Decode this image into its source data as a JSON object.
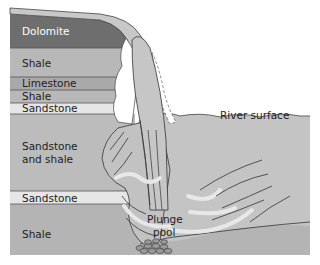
{
  "diagram": {
    "title": "",
    "layers": [
      {
        "name": "Dolomite",
        "color": "#6e6e6e",
        "top": 14,
        "bottom": 48
      },
      {
        "name": "Shale",
        "color": "#b8b8b8",
        "top": 48,
        "bottom": 77
      },
      {
        "name": "Limestone",
        "color": "#a9a9a9",
        "top": 77,
        "bottom": 90
      },
      {
        "name": "Shale",
        "color": "#b8b8b8",
        "top": 90,
        "bottom": 103
      },
      {
        "name": "Sandstone",
        "color": "#e6e6e6",
        "top": 103,
        "bottom": 114
      },
      {
        "name": "Sandstone\nand shale",
        "color": "#bcbcbc",
        "top": 114,
        "bottom": 191
      },
      {
        "name": "Sandstone",
        "color": "#e6e6e6",
        "top": 191,
        "bottom": 204
      },
      {
        "name": "Shale",
        "color": "#b4b4b4",
        "top": 204,
        "bottom": 255
      }
    ],
    "labels": {
      "dolomite": "Dolomite",
      "shale_1": "Shale",
      "limestone": "Limestone",
      "shale_2": "Shale",
      "sandstone_1": "Sandstone",
      "sandstone_and_shale_line1": "Sandstone",
      "sandstone_and_shale_line2": "and shale",
      "sandstone_2": "Sandstone",
      "shale_3": "Shale",
      "river_surface": "River surface",
      "plunge_pool_line1": "Plunge",
      "plunge_pool_line2": "pool"
    },
    "colors": {
      "water": "#c4c4c4",
      "water_light": "#d8d8d8",
      "foam": "#ffffff",
      "outline": "#333333",
      "text_dark": "#222222",
      "text_light": "#ffffff"
    }
  }
}
